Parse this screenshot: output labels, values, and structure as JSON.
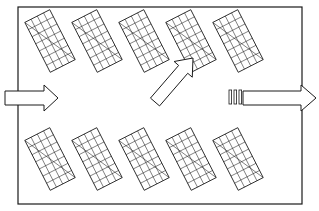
{
  "figure": {
    "kind": "line-drawing",
    "title": "",
    "caption": "",
    "background_color": "#ffffff",
    "stroke_color": "#1a1a1a",
    "fill_color": "#ffffff",
    "canvas": {
      "width": 319,
      "height": 211
    }
  },
  "enclosure": {
    "name": "duct-chamber-outline",
    "label": "",
    "x": 18,
    "y": 7,
    "width": 284,
    "height": 197,
    "stroke_width": 1.2
  },
  "panel_grid": {
    "label": "",
    "panel_count": 10,
    "rows": 2,
    "columns": 5,
    "cell_columns": 4,
    "cell_rows": 7,
    "tilt_degrees": -27,
    "panel_width": 28,
    "panel_height": 56,
    "stroke_width": 0.9,
    "cell_stroke_width": 0.55,
    "row_labels": [
      "top-row",
      "bottom-row"
    ],
    "rows_data": [
      {
        "name": "top-row",
        "center_y": 41,
        "panels": [
          {
            "index": 1,
            "center_x": 50,
            "label": ""
          },
          {
            "index": 2,
            "center_x": 97,
            "label": ""
          },
          {
            "index": 3,
            "center_x": 144,
            "label": ""
          },
          {
            "index": 4,
            "center_x": 191,
            "label": ""
          },
          {
            "index": 5,
            "center_x": 238,
            "label": ""
          }
        ]
      },
      {
        "name": "bottom-row",
        "center_y": 159,
        "panels": [
          {
            "index": 1,
            "center_x": 50,
            "label": ""
          },
          {
            "index": 2,
            "center_x": 97,
            "label": ""
          },
          {
            "index": 3,
            "center_x": 144,
            "label": ""
          },
          {
            "index": 4,
            "center_x": 191,
            "label": ""
          },
          {
            "index": 5,
            "center_x": 238,
            "label": ""
          }
        ]
      }
    ]
  },
  "arrows": {
    "inlet": {
      "name": "inlet-flow-arrow",
      "label": "",
      "direction": "right",
      "tail_x": 5,
      "tip_x": 58,
      "center_y": 98,
      "shaft_half_height": 7,
      "head_half_height": 13,
      "head_length": 14,
      "stroke_width": 1.0
    },
    "outlet": {
      "name": "outlet-flow-arrow",
      "label": "",
      "direction": "right",
      "tail_x": 243,
      "tip_x": 316,
      "center_y": 98,
      "shaft_half_height": 7,
      "head_half_height": 13,
      "head_length": 15,
      "stroke_width": 1.0
    },
    "callout": {
      "name": "callout-pointer-arrow",
      "label": "",
      "direction": "up-right",
      "tail_x": 155,
      "tail_y": 102,
      "tip_x": 193,
      "tip_y": 58,
      "shaft_half_width": 6,
      "head_half_width": 12,
      "head_length": 15,
      "stroke_width": 1.0,
      "points_to_panel": "top-row panel 4"
    }
  },
  "tick_marks": {
    "name": "hatch-tick-marks",
    "label": "",
    "count": 3,
    "x_positions": [
      229,
      234,
      239
    ],
    "top_y": 90,
    "bottom_y": 104,
    "bar_width": 2.6,
    "stroke_width": 0.8
  }
}
